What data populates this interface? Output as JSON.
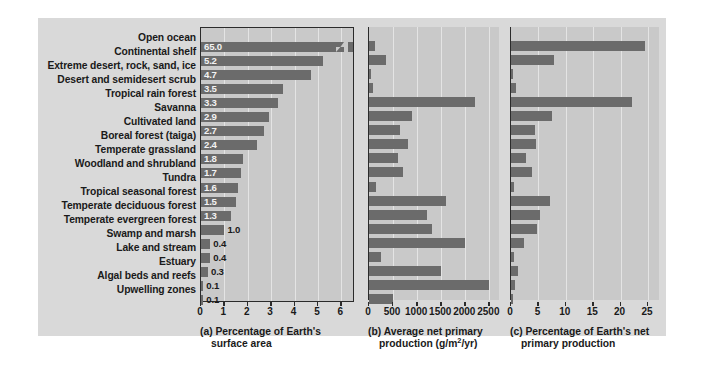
{
  "figure": {
    "background_color": "#d9d9d9",
    "panel_color": "#c9c9c9",
    "bar_color": "#6b6b6b",
    "axis_color": "#2b2b2b"
  },
  "ecosystems": [
    "Open ocean",
    "Continental shelf",
    "Extreme desert, rock, sand, ice",
    "Desert and semidesert scrub",
    "Tropical rain forest",
    "Savanna",
    "Cultivated land",
    "Boreal forest (taiga)",
    "Temperate grassland",
    "Woodland and shrubland",
    "Tundra",
    "Tropical seasonal forest",
    "Temperate deciduous forest",
    "Temperate evergreen forest",
    "Swamp and marsh",
    "Lake and stream",
    "Estuary",
    "Algal beds and reefs",
    "Upwelling zones"
  ],
  "chart_data": [
    {
      "type": "bar",
      "id": "a",
      "title": "(a) Percentage of Earth's surface area",
      "caption_line1": "(a) Percentage of Earth's",
      "caption_line2": "surface area",
      "orientation": "horizontal",
      "xlabel": "",
      "ylabel": "",
      "xlim": [
        0,
        6.5
      ],
      "ticks": [
        0,
        1,
        2,
        3,
        4,
        5,
        6
      ],
      "ticklabels": [
        "0",
        "1",
        "2",
        "3",
        "4",
        "5",
        "6"
      ],
      "grid": true,
      "axis_break": true,
      "axis_break_note": "Open ocean bar (65.0) is truncated with a break symbol",
      "categories": [
        "Open ocean",
        "Continental shelf",
        "Extreme desert, rock, sand, ice",
        "Desert and semidesert scrub",
        "Tropical rain forest",
        "Savanna",
        "Cultivated land",
        "Boreal forest (taiga)",
        "Temperate grassland",
        "Woodland and shrubland",
        "Tundra",
        "Tropical seasonal forest",
        "Temperate deciduous forest",
        "Temperate evergreen forest",
        "Swamp and marsh",
        "Lake and stream",
        "Estuary",
        "Algal beds and reefs",
        "Upwelling zones"
      ],
      "values": [
        65.0,
        5.2,
        4.7,
        3.5,
        3.3,
        2.9,
        2.7,
        2.4,
        1.8,
        1.7,
        1.6,
        1.5,
        1.3,
        1.0,
        0.4,
        0.4,
        0.3,
        0.1,
        0.1
      ],
      "datalabels": [
        "65.0",
        "5.2",
        "4.7",
        "3.5",
        "3.3",
        "2.9",
        "2.7",
        "2.4",
        "1.8",
        "1.7",
        "1.6",
        "1.5",
        "1.3",
        "1.0",
        "0.4",
        "0.4",
        "0.3",
        "0.1",
        "0.1"
      ]
    },
    {
      "type": "bar",
      "id": "b",
      "title": "(b) Average net primary production (g/m2/yr)",
      "caption_line1_pre": "(b) Average net primary",
      "caption_line2_pre": "production (g/m",
      "caption_line2_sup": "2",
      "caption_line2_post": "/yr)",
      "orientation": "horizontal",
      "xlabel": "g/m2/yr",
      "ylabel": "",
      "xlim": [
        0,
        2700
      ],
      "ticks": [
        0,
        500,
        1000,
        1500,
        2000,
        2500
      ],
      "ticklabels": [
        "0",
        "500",
        "1000",
        "1500",
        "2000",
        "2500"
      ],
      "grid": true,
      "categories": [
        "Open ocean",
        "Continental shelf",
        "Extreme desert, rock, sand, ice",
        "Desert and semidesert scrub",
        "Tropical rain forest",
        "Savanna",
        "Cultivated land",
        "Boreal forest (taiga)",
        "Temperate grassland",
        "Woodland and shrubland",
        "Tundra",
        "Tropical seasonal forest",
        "Temperate deciduous forest",
        "Temperate evergreen forest",
        "Swamp and marsh",
        "Lake and stream",
        "Estuary",
        "Algal beds and reefs",
        "Upwelling zones"
      ],
      "values": [
        125,
        360,
        3,
        90,
        2200,
        900,
        650,
        800,
        600,
        700,
        140,
        1600,
        1200,
        1300,
        2000,
        250,
        1500,
        2500,
        500
      ]
    },
    {
      "type": "bar",
      "id": "c",
      "title": "(c) Percentage of Earth's net primary production",
      "caption_line1": "(c) Percentage of Earth's net",
      "caption_line2": "primary production",
      "orientation": "horizontal",
      "xlabel": "",
      "ylabel": "",
      "xlim": [
        0,
        27
      ],
      "ticks": [
        0,
        5,
        10,
        15,
        20,
        25
      ],
      "ticklabels": [
        "0",
        "5",
        "10",
        "15",
        "20",
        "25"
      ],
      "grid": true,
      "categories": [
        "Open ocean",
        "Continental shelf",
        "Extreme desert, rock, sand, ice",
        "Desert and semidesert scrub",
        "Tropical rain forest",
        "Savanna",
        "Cultivated land",
        "Boreal forest (taiga)",
        "Temperate grassland",
        "Woodland and shrubland",
        "Tundra",
        "Tropical seasonal forest",
        "Temperate deciduous forest",
        "Temperate evergreen forest",
        "Swamp and marsh",
        "Lake and stream",
        "Estuary",
        "Algal beds and reefs",
        "Upwelling zones"
      ],
      "values": [
        24.4,
        7.8,
        0.1,
        0.9,
        22.0,
        7.5,
        4.3,
        4.5,
        2.7,
        3.9,
        0.6,
        7.1,
        5.2,
        4.8,
        2.3,
        0.5,
        1.3,
        0.7,
        0.2
      ]
    }
  ]
}
